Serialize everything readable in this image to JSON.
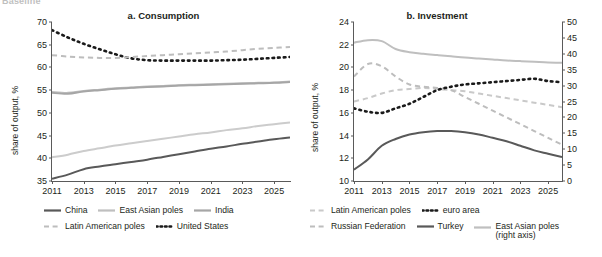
{
  "crop_text": "Baseline",
  "panels": [
    {
      "id": "a",
      "title": "a. Consumption",
      "ylabel": "share of output, %"
    },
    {
      "id": "b",
      "title": "b. Investment",
      "ylabel": "share of output, %"
    }
  ],
  "legend_a": [
    [
      {
        "label": "China",
        "style": "solid",
        "color": "#595959",
        "width": 2.2
      },
      {
        "label": "East Asian poles",
        "style": "solid",
        "color": "#bfbfbf",
        "width": 2.2
      },
      {
        "label": "India",
        "style": "solid",
        "color": "#a6a6a6",
        "width": 2.2
      }
    ],
    [
      {
        "label": "Latin American poles",
        "style": "dashed",
        "color": "#bdbdbd",
        "width": 2.2
      },
      {
        "label": "United States",
        "style": "dotted",
        "color": "#1a1a1a",
        "width": 2.6
      }
    ]
  ],
  "legend_b": [
    [
      {
        "label": "Latin American poles",
        "style": "dashed",
        "color": "#c9c9c9",
        "width": 2.2
      },
      {
        "label": "euro area",
        "style": "dotted",
        "color": "#1a1a1a",
        "width": 2.6
      }
    ],
    [
      {
        "label": "Russian Federation",
        "style": "dashed",
        "color": "#bdbdbd",
        "width": 2.2
      },
      {
        "label": "Turkey",
        "style": "solid",
        "color": "#595959",
        "width": 2.2
      },
      {
        "label": "East Asian poles",
        "sublabel": "(right axis)",
        "style": "solid",
        "color": "#bfbfbf",
        "width": 2.2
      }
    ]
  ],
  "chart_data": [
    {
      "type": "line",
      "panel": "a",
      "title": "a. Consumption",
      "xlabel": "",
      "ylabel": "share of output, %",
      "xlim": [
        2011,
        2026
      ],
      "ylim": [
        35,
        70
      ],
      "yticks": [
        35,
        40,
        45,
        50,
        55,
        60,
        65,
        70
      ],
      "xticks": [
        2011,
        2013,
        2015,
        2017,
        2019,
        2021,
        2023,
        2025
      ],
      "grid": false,
      "legend_position": "below",
      "x": [
        2011,
        2012,
        2013,
        2014,
        2015,
        2016,
        2017,
        2018,
        2019,
        2020,
        2021,
        2022,
        2023,
        2024,
        2025,
        2026
      ],
      "series": [
        {
          "name": "United States",
          "style": "dotted",
          "color": "#1a1a1a",
          "values": [
            68.2,
            66.6,
            65.2,
            64.0,
            62.9,
            62.0,
            61.6,
            61.5,
            61.5,
            61.5,
            61.5,
            61.6,
            61.7,
            61.9,
            62.1,
            62.3
          ]
        },
        {
          "name": "Latin American poles",
          "style": "dashed",
          "color": "#bdbdbd",
          "values": [
            62.7,
            62.4,
            62.2,
            62.1,
            62.1,
            62.3,
            62.5,
            62.7,
            62.9,
            63.1,
            63.3,
            63.5,
            63.8,
            64.1,
            64.3,
            64.5
          ]
        },
        {
          "name": "East Asian poles",
          "style": "solid",
          "color": "#bfbfbf",
          "values": [
            54.6,
            54.4,
            54.8,
            55.1,
            55.4,
            55.6,
            55.8,
            55.9,
            56.1,
            56.2,
            56.3,
            56.4,
            56.5,
            56.6,
            56.7,
            56.9
          ]
        },
        {
          "name": "India",
          "style": "solid",
          "color": "#a6a6a6",
          "values": [
            54.4,
            54.2,
            54.7,
            55.0,
            55.3,
            55.5,
            55.7,
            55.8,
            56.0,
            56.1,
            56.2,
            56.3,
            56.4,
            56.5,
            56.6,
            56.8
          ]
        },
        {
          "name": "India-low",
          "style": "solid",
          "color": "#cccccc",
          "values": [
            40.2,
            40.8,
            41.6,
            42.2,
            42.8,
            43.3,
            43.8,
            44.3,
            44.8,
            45.3,
            45.7,
            46.2,
            46.6,
            47.1,
            47.5,
            47.9
          ]
        },
        {
          "name": "China",
          "style": "solid",
          "color": "#595959",
          "values": [
            35.5,
            36.4,
            37.6,
            38.2,
            38.7,
            39.2,
            39.7,
            40.3,
            40.9,
            41.5,
            42.1,
            42.6,
            43.2,
            43.7,
            44.2,
            44.6
          ]
        }
      ]
    },
    {
      "type": "line",
      "panel": "b",
      "title": "b. Investment",
      "xlabel": "",
      "ylabel": "share of output, %",
      "xlim": [
        2011,
        2026
      ],
      "ylim": [
        10,
        24
      ],
      "yticks": [
        10,
        12,
        14,
        16,
        18,
        20,
        22,
        24
      ],
      "ylim_right": [
        0,
        50
      ],
      "yticks_right": [
        0,
        5,
        10,
        15,
        20,
        25,
        30,
        35,
        40,
        45,
        50
      ],
      "xticks": [
        2011,
        2013,
        2015,
        2017,
        2019,
        2021,
        2023,
        2025
      ],
      "grid": false,
      "legend_position": "below",
      "x": [
        2011,
        2012,
        2013,
        2014,
        2015,
        2016,
        2017,
        2018,
        2019,
        2020,
        2021,
        2022,
        2023,
        2024,
        2025,
        2026
      ],
      "series": [
        {
          "name": "East Asian poles (right axis)",
          "style": "solid",
          "color": "#bfbfbf",
          "axis": "right",
          "values": [
            43.5,
            44.3,
            44.0,
            41.5,
            40.5,
            40.0,
            39.6,
            39.2,
            38.8,
            38.5,
            38.2,
            37.9,
            37.7,
            37.5,
            37.3,
            37.2
          ]
        },
        {
          "name": "Latin American poles",
          "style": "dashed",
          "color": "#c9c9c9",
          "axis": "left",
          "values": [
            17.0,
            17.3,
            17.7,
            18.0,
            18.1,
            18.2,
            18.1,
            18.0,
            17.9,
            17.7,
            17.5,
            17.3,
            17.1,
            16.9,
            16.7,
            16.5
          ]
        },
        {
          "name": "Russian Federation",
          "style": "dashed",
          "color": "#bdbdbd",
          "axis": "left",
          "values": [
            19.2,
            20.3,
            20.1,
            19.2,
            18.5,
            18.3,
            18.2,
            18.0,
            17.4,
            16.8,
            16.2,
            15.6,
            15.0,
            14.4,
            13.8,
            13.2
          ]
        },
        {
          "name": "euro area",
          "style": "dotted",
          "color": "#1a1a1a",
          "axis": "left",
          "values": [
            16.4,
            16.1,
            16.0,
            16.4,
            16.8,
            17.4,
            18.0,
            18.3,
            18.5,
            18.6,
            18.7,
            18.8,
            18.9,
            19.0,
            18.8,
            18.7
          ]
        },
        {
          "name": "Turkey",
          "style": "solid",
          "color": "#595959",
          "axis": "left",
          "values": [
            11.0,
            11.9,
            13.1,
            13.7,
            14.1,
            14.3,
            14.4,
            14.4,
            14.3,
            14.1,
            13.8,
            13.5,
            13.1,
            12.7,
            12.4,
            12.1
          ]
        }
      ]
    }
  ]
}
